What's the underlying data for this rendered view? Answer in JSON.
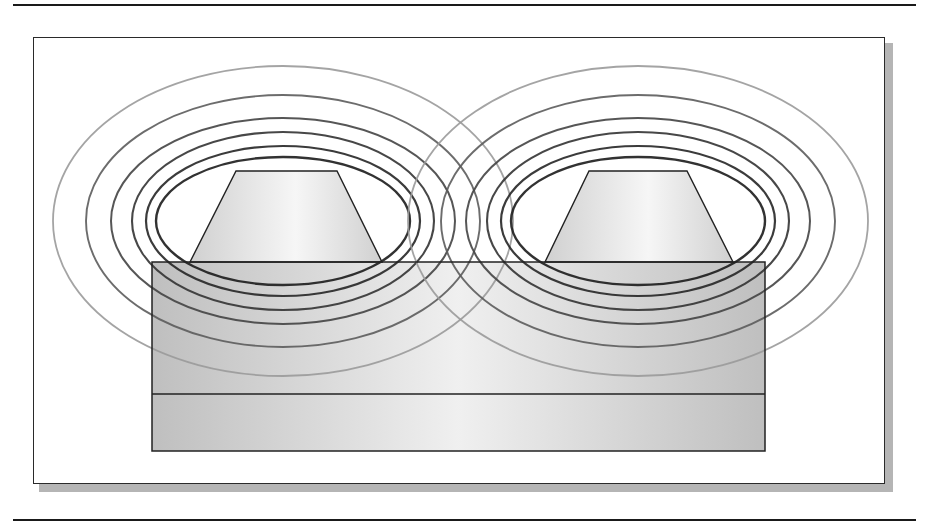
{
  "figure": {
    "top_rule": true,
    "bottom_rule": true
  },
  "colors": {
    "rule": "#1a1a1a",
    "frame_border": "#2a2a2a",
    "frame_shadow": "#b5b5b5",
    "conductor_edge": "#d0d0d0",
    "conductor_center": "#f6f6f6",
    "slab_edge": "#b8b8b8",
    "slab_center": "#eeeeee",
    "outline": "#222222"
  },
  "slab": {
    "x": 152,
    "y": 262,
    "width": 613,
    "height": 189,
    "divider_y": 394,
    "layers": [
      "upper-dielectric",
      "lower-substrate"
    ]
  },
  "conductors": [
    {
      "name": "left-conductor",
      "points": "236,171 337,171 382,262 190,262"
    },
    {
      "name": "right-conductor",
      "points": "589,171 687,171 733,262 545,262"
    }
  ],
  "field_lines": {
    "left_center": {
      "cx": 283,
      "cy": 221
    },
    "right_center": {
      "cx": 638,
      "cy": 221
    },
    "rings": [
      {
        "rx": 127,
        "ry": 64,
        "color": "#1c1c1c",
        "width": 2.4
      },
      {
        "rx": 137,
        "ry": 75,
        "color": "#262626",
        "width": 2.2
      },
      {
        "rx": 151,
        "ry": 89,
        "color": "#333333",
        "width": 2.1
      },
      {
        "rx": 172,
        "ry": 103,
        "color": "#444444",
        "width": 2.0
      },
      {
        "rx": 197,
        "ry": 126,
        "color": "#5c5c5c",
        "width": 1.9
      },
      {
        "rx": 230,
        "ry": 155,
        "color": "#9a9a9a",
        "width": 1.8
      }
    ]
  }
}
